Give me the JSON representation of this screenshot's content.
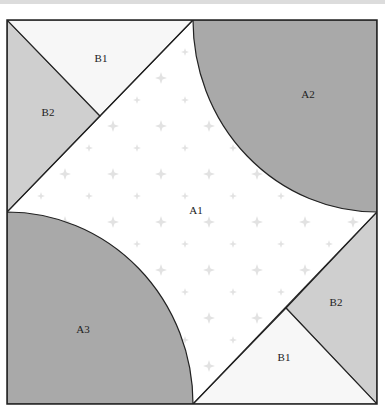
{
  "diagram": {
    "type": "quilt-block-template",
    "colors": {
      "outline": "#222222",
      "arc_fill": "#a9a9a9",
      "b1_fill": "#f7f7f7",
      "b2_fill": "#cfcfcf",
      "a1_fill": "#ffffff",
      "star": "#e2e2e2",
      "topbar": "#dcdcdc"
    },
    "labels": {
      "a1": "A1",
      "a2": "A2",
      "a3": "A3",
      "b1_top": "B1",
      "b2_top": "B2",
      "b1_bottom": "B1",
      "b2_bottom": "B2"
    }
  }
}
